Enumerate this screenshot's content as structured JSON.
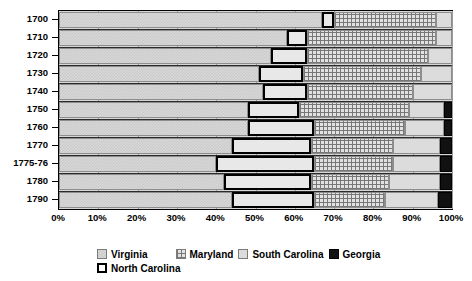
{
  "chart_data": {
    "type": "bar",
    "orientation": "horizontal",
    "stacked": true,
    "normalized": true,
    "title": "",
    "subtitle": "",
    "xlabel": "",
    "ylabel": "",
    "xlim": [
      0,
      100
    ],
    "grid": true,
    "legend_position": "bottom",
    "x_tick_labels": [
      "0%",
      "10%",
      "20%",
      "30%",
      "40%",
      "50%",
      "60%",
      "70%",
      "80%",
      "90%",
      "100%"
    ],
    "x_tick_values": [
      0,
      10,
      20,
      30,
      40,
      50,
      60,
      70,
      80,
      90,
      100
    ],
    "categories": [
      "1700",
      "1710",
      "1720",
      "1730",
      "1740",
      "1750",
      "1760",
      "1770",
      "1775-76",
      "1780",
      "1790"
    ],
    "series": [
      {
        "name": "Virginia",
        "pattern": "light-checker-gray",
        "color": "#d7d7d7",
        "values": [
          67,
          58,
          54,
          51,
          52,
          48,
          48,
          44,
          40,
          42,
          44
        ]
      },
      {
        "name": "North Carolina",
        "pattern": "white-thick-outline",
        "color": "#e8e8e8",
        "values": [
          3,
          5,
          9,
          11,
          11,
          13,
          17,
          20,
          25,
          22,
          21
        ]
      },
      {
        "name": "Maryland",
        "pattern": "cross-hatch-grid",
        "color": "#e2e2e2",
        "values": [
          26,
          33,
          31,
          30,
          27,
          28,
          23,
          21,
          20,
          20,
          18
        ]
      },
      {
        "name": "South Carolina",
        "pattern": "solid-light-gray",
        "color": "#dcdcdc",
        "values": [
          4,
          4,
          6,
          8,
          10,
          9,
          10,
          12,
          12,
          13,
          13.5
        ]
      },
      {
        "name": "Georgia",
        "pattern": "solid-black",
        "color": "#111111",
        "values": [
          0,
          0,
          0,
          0,
          0,
          2,
          2,
          3,
          3,
          3,
          3.5
        ]
      }
    ]
  },
  "legend": {
    "line1": [
      {
        "label": "Virginia",
        "key": "virginia"
      },
      {
        "label": "Maryland",
        "key": "maryland"
      },
      {
        "label": "South Carolina",
        "key": "southcarolina"
      },
      {
        "label": "Georgia",
        "key": "georgia"
      }
    ],
    "line2": [
      {
        "label": "North Carolina",
        "key": "northcarolina"
      }
    ]
  }
}
